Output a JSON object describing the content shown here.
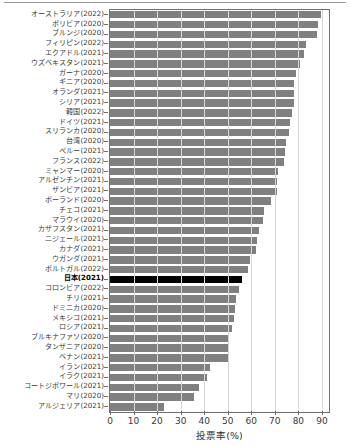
{
  "chart_data": {
    "type": "bar",
    "orientation": "horizontal",
    "title": "",
    "xlabel": "投票率(%)",
    "ylabel": "",
    "xlim": [
      0,
      93
    ],
    "xticks": [
      0,
      10,
      20,
      30,
      40,
      50,
      60,
      70,
      80,
      90
    ],
    "xtick_labels": [
      "0",
      "10",
      "20",
      "30",
      "40",
      "50",
      "60",
      "70",
      "80",
      "90"
    ],
    "grid": true,
    "grid_axis": "x",
    "legend": "none",
    "bar_color": "#808080",
    "highlight_color": "#000000",
    "highlight_category": "日本(2021)",
    "categories": [
      "オーストラリア(2022)",
      "ボリビア(2020)",
      "ブルンジ(2020)",
      "フィリピン(2022)",
      "エクアドル(2021)",
      "ウズベキスタン(2021)",
      "ガーナ(2020)",
      "ギニア(2020)",
      "オランダ(2021)",
      "シリア(2021)",
      "韓国(2022)",
      "ドイツ(2021)",
      "スリランカ(2020)",
      "台湾(2020)",
      "ペルー(2021)",
      "フランス(2022)",
      "ミャンマー(2020)",
      "アルゼンチン(2021)",
      "ザンビア(2021)",
      "ポーランド(2020)",
      "チェコ(2021)",
      "マラウイ(2020)",
      "カザフスタン(2021)",
      "ニジェール(2021)",
      "カナダ(2021)",
      "ウガンダ(2021)",
      "ポルトガル(2022)",
      "日本(2021)",
      "コロンビア(2022)",
      "チリ(2021)",
      "ドミニカ(2020)",
      "メキシコ(2021)",
      "ロシア(2021)",
      "ブルキナファソ(2020)",
      "タンザニア(2020)",
      "ベナン(2021)",
      "イラン(2021)",
      "イラク(2021)",
      "コートジボワール(2021)",
      "マリ(2020)",
      "アルジェリア(2021)"
    ],
    "values": [
      89.8,
      88.4,
      87.7,
      83.1,
      82.5,
      80.8,
      79.0,
      78.2,
      78.0,
      78.0,
      77.1,
      76.6,
      75.9,
      74.9,
      74.5,
      73.7,
      71.5,
      71.0,
      70.9,
      68.2,
      65.4,
      64.8,
      63.3,
      62.6,
      62.2,
      59.4,
      58.6,
      55.9,
      54.9,
      53.4,
      53.0,
      52.7,
      51.7,
      50.1,
      50.0,
      49.9,
      42.6,
      41.0,
      37.9,
      35.6,
      23.0
    ],
    "unit": "%"
  }
}
